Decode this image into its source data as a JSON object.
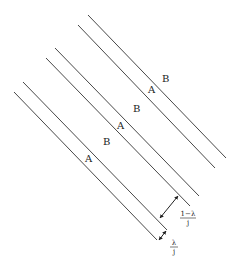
{
  "diagram": {
    "type": "parallel-lines-stripe-diagram",
    "line_color": "#333333",
    "lines": [
      {
        "id": 1,
        "x1": 88,
        "y1": 15,
        "x2": 226,
        "y2": 158
      },
      {
        "id": 2,
        "x1": 78,
        "y1": 25,
        "x2": 215,
        "y2": 168
      },
      {
        "id": 3,
        "x1": 55,
        "y1": 48,
        "x2": 199,
        "y2": 196
      },
      {
        "id": 4,
        "x1": 46,
        "y1": 58,
        "x2": 190,
        "y2": 206
      },
      {
        "id": 5,
        "x1": 23,
        "y1": 82,
        "x2": 167,
        "y2": 230
      },
      {
        "id": 6,
        "x1": 14,
        "y1": 92,
        "x2": 157,
        "y2": 240
      }
    ],
    "labels": [
      {
        "text": "B",
        "x": 162,
        "y": 82
      },
      {
        "text": "A",
        "x": 148,
        "y": 93
      },
      {
        "text": "B",
        "x": 133,
        "y": 112
      },
      {
        "text": "A",
        "x": 117,
        "y": 129
      },
      {
        "text": "B",
        "x": 103,
        "y": 145
      },
      {
        "text": "A",
        "x": 85,
        "y": 162
      }
    ],
    "dimension_1": {
      "numerator": "1−λ",
      "denominator": "j",
      "x1": 160,
      "y1": 218,
      "x2": 178,
      "y2": 196
    },
    "dimension_2": {
      "numerator": "λ",
      "denominator": "j",
      "x1": 159,
      "y1": 240,
      "x2": 166,
      "y2": 231
    }
  }
}
